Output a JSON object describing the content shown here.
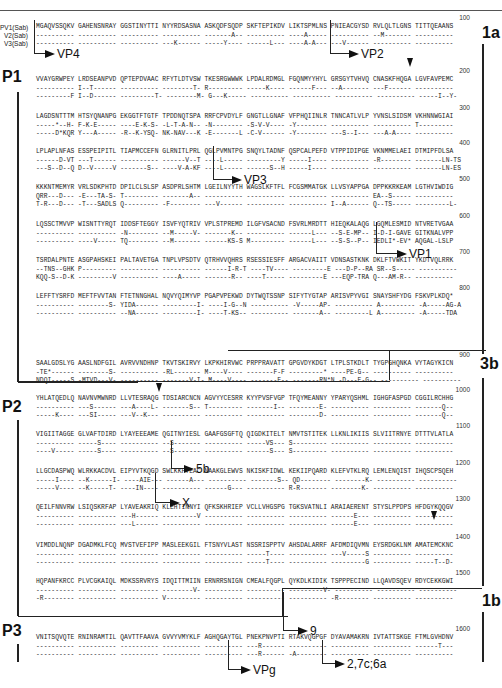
{
  "figure": {
    "row_labels": [
      "PV1(Sab)",
      "V2(Sab)",
      "V3(Sab)"
    ],
    "regions": [
      "P1",
      "P2",
      "P3"
    ],
    "sections": [
      "1a",
      "3b",
      "1b"
    ],
    "cleavage_labels": {
      "vp4": "VP4",
      "vp2": "VP2",
      "vp3": "VP3",
      "vp1": "VP1",
      "5b": "5b",
      "x": "X",
      "9": "9",
      "vpg": "VPg",
      "2_7c_6a": "2,7c;6a"
    },
    "blocks": [
      {
        "number": "100",
        "rows": [
          "MGAQVSSQKV GAHENSNRAY GGSTINYTTI NYYRDSASNA ASKQDFSQDP SKFTEPIKDV LIKTSPMLNS PNIEACGYSD RVLQLTLGNS TITTQEAANS",
          "---------- ---------- ---------- ---------- -------A-- ---------- ----A----- ---------- --M------- ----------",
          "---------- ---------- ---------- ---K------ -----Y---- ------L--- ----A-A--- ---V------ ---------- ----------"
        ]
      },
      {
        "number": "200",
        "rows": [
          "VVAYGRWPEY LRDSEANPVD QPTEPDVAAC RFYTLDTVSW TKESRGWWWK LPDALRDMGL FGQNMYYHYL GRSGYTVHVQ CNASKFHQGA LGVFAVPEMC",
          "---------- I--T------ ---------- --------T- R--------- -----K---- ------F--- --A------- ---F------ ----------",
          "---------F I--D------ ---------T- --------M- G---K----- ---------- ---------- ---------- ---------- -----I--Y-"
        ]
      },
      {
        "number": "300",
        "rows": [
          "LAGDSNTTTM HTSYQNANPG EKGGTFTGTF TPDDNQTSPA RRFCPVDYLF GNGTLLGNAF VFPHQIINLR TNNCATLVLP YVNSLSIDSM VKHNNWGIAI",
          "-----*--H- F-K-E----- ----E-K-S- -L-T-A-N-- -N-------- -S-V-V---- -Y-------- ---------- ---------- T---------",
          "-----D*KQR Y---A----- -R--K-YSQ- NK-NAV---K -E-------L -C-V------ -Y-------- ---S--I--- ---A-A---- ----------"
        ]
      },
      {
        "number": "400",
        "rows": [
          "LPLAPLNFAS ESSPEIPITL TIAPMCCEFN GLRNITLPRL QGLPVMNTPG SNQYLTADNF QSPCALPEFD VTPPIDIPGE VKNMMELAEI DTMIPFDLSA",
          "------D-VT ---T------ ---------- ------V--T ----L----- ---------Y -----I---- ---------- -R-------- -------LN-TS",
          "---S--D--Q D--V-----V -------S-- ----V-A-KF ----L----- ------S--H -----I---- ---------- ---------- -------LN-ES"
        ]
      },
      {
        "number": "500",
        "rows": [
          "KKKNTMEMYR VRLSDKPHTD DPILCLSLSP ASDPRLSHTM LGEILNYYTH WAGSLKFTFL FCGSMMATGK LLVSYAPPGA DPPKKRKEAM LGTHVIWDIG",
          "QRR---D--- -E---TA-S- T--------- -------A-- ---------- ---------- ---------- ---------- EA--S----- ----------",
          "T-R---D--- -T---SADLS Q--------- -F-------- ---V------ ---------- ---------- I--A------ Q--TS----- ---------L-"
        ]
      },
      {
        "number": "600",
        "rows": [
          "LQSSCTMVVP WISNTTYRQT IDDSFTEGGY ISVFYQTRIV VPLSTPREMD ILGFVSACND FSVRLMRDTT HIEQKALAQG LGQMLESMID NTVRETVGAA",
          "---------- ---------- -N-------- --M-----V- -------K-- ---------- ------L--- --S-E-MP-- I-D-I-GAVE GITKNALVPP",
          "---------- ----V----- TQ-------- --M------- ------KS-S M--------- ------L--- --S-S--P-- IEDLI*-EV* AQGAL-LSLP"
        ]
      },
      {
        "number": "700",
        "rows": [
          "TSRDALPNTE ASGPAHSKEI PALTAVETGA TNPLVPSDTV QTRHVVQHRS RSESSIESFF ARGACVAIIT VDNSASTKNK DKLFTVWKIT YKDTVQLRRK",
          "--TNS--GHK P--------- ---------- ---------- ------I-R-T ----TV---- ---------E ---D-P--RA SR--S----- ----------",
          "KQQ-S--D-K ---------V ---------- ----A----- -------R-- ----T----- ---------E ---EQP-TRA Q---AM-R-- ----------"
        ]
      },
      {
        "number": "800",
        "rows": [
          "LEFFTYSRFD MEFTFVVTAN FTETNNGHAL NQVYQIMYVP PGAPVPEKWD DYTWQTSSNP SIFYTYGTAP ARISVPYVGI SNAYSHFYDG FSKVPLKDQ*",
          "---------- --------S- YIDA------ ---------I- ----I-G--N ---------- -V-----AP- ---------- A--------- -A-----AG-A",
          "---------- ---------- --NA------ ---------I- ----T-KS-- ---------- -------A-- ---------L A--------- -A-----TDA"
        ]
      },
      {
        "number": "900",
        "rows": [
          "SAALGDSLYG AASLNDFGIL AVRVVNDHNP TKVTSKIRVY LKPKHIRVWC PRPPRAVATT GPGVDYKDGT LTPLSTKDLT TYGPGHQNKA VYTAGYKICN",
          "-TE*------ --------S- ---------- -RL------- M----V---- -------F-F ---------* ----PE-G-- ---------- ----------",
          "NDQI-----S -MTVD---V- ---------- -------V-I- M----V---- -------F-- -------RN*N -D---E-G-- ---------- ----------"
        ]
      },
      {
        "number": "1000",
        "rows": [
          "YHLATQEDLQ NAVNVMWNRD LLVTESRAQG TDSIARCNCN AGVYYCESRR KYYPVSFVGP TFQYMEANNY YPARYQSHML IGHGFASPGD CGGILRCHHG",
          "---------- ---S------ ---A----L- -------S-- T--------- -------I-- --------E- ---------- ---------- -------Q--",
          "-----K---- ---SI----- ---V--K--- ---------- ---------- ---------- --------D- ---------- ---------- -------Q--"
        ]
      },
      {
        "number": "1100",
        "rows": [
          "VIGIITAGGE GLVAFTDIRD LYAYEEEAME QGITNYIESL GAAFGSGFTQ QIGDKITELT NMVTSTITEK LLKNLIKIIS SLVIITRNYE DTTTVLATLA",
          "---------- -----S---- ---------- --S------- ---------- -----VS--- S--------- ---------- ---------- ----------",
          "----V----- -----S---- ---------- --S------- ---------- ------S--- S--------- ---------- ---------- ----------"
        ]
      },
      {
        "number": "1200",
        "rows": [
          "LLGCDASPWQ WLRKKACDVL EIPYVTKQGD SWLKKFTEAC NAAKGLEWVS NKISKFIDWL KEKIIPQARD KLEFVTKLRQ LEMLENQIST IHQSCPSQEH",
          "-----I---- --K------I- ----AIE--- ------A--- ---------- -------S-- QD-------- --------K- ---------- ----------",
          "-----V---- --K-----T- ----IN---- ---------- ------G--- ---------- R-R------- --------K- ---------- ----------"
        ]
      },
      {
        "number": "1300",
        "rows": [
          "QEILFNNVRW LSIQSKRFAP LYAVEAKRIQ KLEHTINNYI QFKSKHRIEP VCLLVHGSPG TGKSVATNLI ARAIAERENT STYSLPPDPS HFDGYKQQGV",
          "---------- ---------- ---H------ ---------V ---------- ---------- ---------- ------E--- ---------- ----------",
          "---------- ---------- ---L------ ---------- ---------- ---------- ---------- ------E--- ---------- ----------"
        ]
      },
      {
        "number": "1400",
        "rows": [
          "VIMDDLNQNP DGADMKLFCQ MVSTVEFIPP MASLEEKGIL FTSNYVLAST NSSRISPPTV AHSDALARRF AFDMDIQVMN EYSRDGKLNM AMATEMCKNC",
          "---------- ---------- ---------- ---------- ---------- -----T---- ---------- ---V-----S ---------- ----------",
          "---------- ---------- ---------- ---------- ---------- -----T---- ---------- ---------G ---------- -----T--D-"
        ]
      },
      {
        "number": "1500",
        "rows": [
          "HQPANFKRCC PLVCGKAIQL MDKSSRVRYS IDQITTMIIN ERNRRSNIGN CMEALFQGPL QYKDLKIDIK TSPPPECIND LLQAVDSQEV RDYCEKKGWI",
          "---------- ---------- ---------- --------V- ---------- ---------- ---------V- ---------- ---------- ----------",
          "-R-------- ---------- ---------- V--------- ---------- ---------- ---------- -R-------- ---------- ----------"
        ]
      },
      {
        "number": "1600",
        "rows": [
          "VNITSQVQTE RNINRAMTIL QAVTTFAAVA GVVYVMYKLF AGHQGAYTGL PNEKPNVPTI RTAKVQGPGF DYAVAMAKRN IVTATTSKGE FTMLGVHDNV",
          "---------- ---------- ---------- ---------- ---------- ---R------ ---------- ---------- ---------- ------T---",
          "---------- ---------- ---------- ---------- ---------- ---R------ -A-------- ---------- ---------- ----------"
        ]
      }
    ]
  }
}
